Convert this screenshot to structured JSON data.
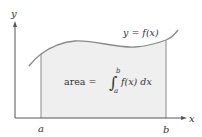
{
  "diagram": {
    "axis_labels": {
      "x": "x",
      "y": "y"
    },
    "bounds": {
      "a": "a",
      "b": "b"
    },
    "curve_label": "y = f(x)",
    "formula": {
      "prefix": "area =",
      "integral_sign": "∫",
      "upper": "b",
      "lower": "a",
      "integrand": "f(x) dx"
    },
    "colors": {
      "fill": "#efefef",
      "curve": "#8a8a8a",
      "axis": "#555555",
      "text": "#333333"
    }
  }
}
